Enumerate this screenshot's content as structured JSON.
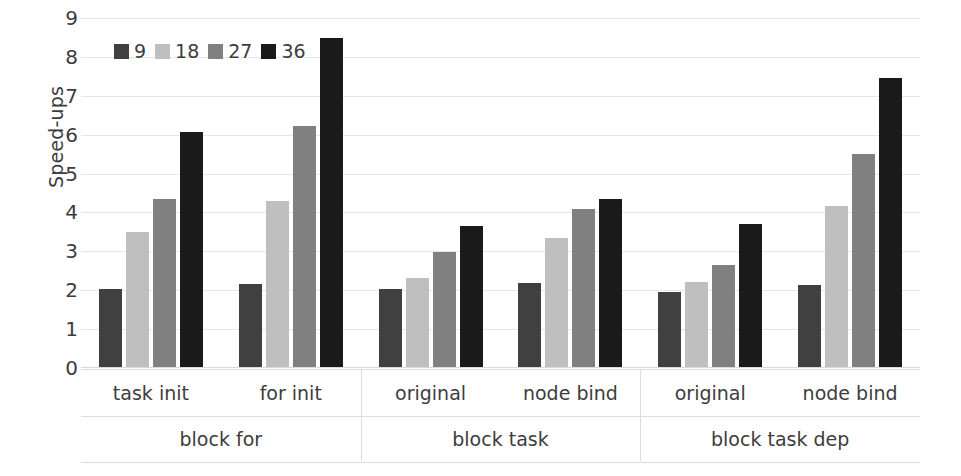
{
  "chart_data": {
    "type": "bar",
    "title": "",
    "xlabel": "",
    "ylabel": "Speed-ups",
    "ylim": [
      0,
      9
    ],
    "ytick_labels": [
      "0",
      "1",
      "2",
      "3",
      "4",
      "5",
      "6",
      "7",
      "8",
      "9"
    ],
    "grid": true,
    "legend_position": "top-left",
    "legend_title": "",
    "series": [
      {
        "name": "9",
        "color": "#404040",
        "values": [
          2.0,
          2.14,
          2.0,
          2.16,
          1.93,
          2.11
        ]
      },
      {
        "name": "18",
        "color": "#bfbfbf",
        "values": [
          3.47,
          4.28,
          2.29,
          3.33,
          2.19,
          4.13
        ]
      },
      {
        "name": "27",
        "color": "#808080",
        "values": [
          4.33,
          6.21,
          2.96,
          4.07,
          2.63,
          5.48
        ]
      },
      {
        "name": "36",
        "color": "#1a1a1a",
        "values": [
          6.05,
          8.45,
          3.62,
          4.31,
          3.67,
          7.44
        ]
      }
    ],
    "categories": [
      "task init",
      "for init",
      "original",
      "node bind",
      "original",
      "node bind"
    ],
    "groups": [
      {
        "label": "block for",
        "categories": [
          "task init",
          "for init"
        ]
      },
      {
        "label": "block task",
        "categories": [
          "original",
          "node bind"
        ]
      },
      {
        "label": "block task dep",
        "categories": [
          "original",
          "node bind"
        ]
      }
    ]
  },
  "colors": {
    "background": "#ffffff",
    "text": "#3d3d3d",
    "gridline": "#e6e6e6",
    "axis_line": "#dcdcdc"
  }
}
